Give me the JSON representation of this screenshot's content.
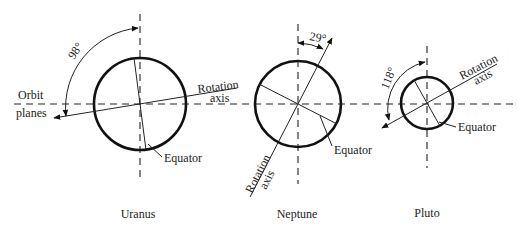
{
  "figure": {
    "planets": [
      {
        "name": "Uranus",
        "axial_tilt_label": "98°",
        "rotation_axis_label_line1": "Rotation",
        "rotation_axis_label_line2": "axis",
        "equator_label": "Equator"
      },
      {
        "name": "Neptune",
        "axial_tilt_label": "29°",
        "rotation_axis_label_line1": "Rotation",
        "rotation_axis_label_line2": "axis",
        "equator_label": "Equator"
      },
      {
        "name": "Pluto",
        "axial_tilt_label": "118°",
        "rotation_axis_label_line1": "Rotation",
        "rotation_axis_label_line2": "axis",
        "equator_label": "Equator"
      }
    ],
    "orbit_label_line1": "Orbit",
    "orbit_label_line2": "planes",
    "colors": {
      "line": "#222222",
      "background": "#ffffff"
    }
  }
}
